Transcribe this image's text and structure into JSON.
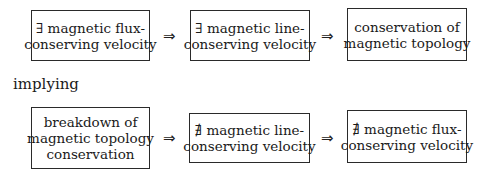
{
  "top_row": {
    "boxes": [
      {
        "lines": [
          "∃ magnetic flux-",
          "conserving velocity"
        ]
      },
      {
        "lines": [
          "∃ magnetic line-",
          "conserving velocity"
        ]
      },
      {
        "lines": [
          "conservation of",
          "magnetic topology"
        ]
      }
    ],
    "arrows": [
      "⇒",
      "⇒"
    ]
  },
  "connector_text": "implying",
  "bottom_row": {
    "boxes": [
      {
        "lines": [
          "breakdown of",
          "magnetic topology",
          "conservation"
        ]
      },
      {
        "lines": [
          "∄ magnetic line-",
          "conserving velocity"
        ]
      },
      {
        "lines": [
          "∄ magnetic flux-",
          "conserving velocity"
        ]
      }
    ],
    "arrows": [
      "⇒",
      "⇒"
    ]
  }
}
